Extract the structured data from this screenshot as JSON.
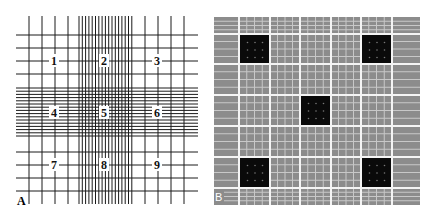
{
  "figure": {
    "panels": [
      {
        "id": "A",
        "label": "A",
        "description": "Hemocytometer counting-chamber ruling (Neubauer grid) with nine numbered large squares",
        "squares": [
          {
            "number": "1",
            "label": "1"
          },
          {
            "number": "2",
            "label": "2"
          },
          {
            "number": "3",
            "label": "3"
          },
          {
            "number": "4",
            "label": "4"
          },
          {
            "number": "5",
            "label": "5"
          },
          {
            "number": "6",
            "label": "6"
          },
          {
            "number": "7",
            "label": "7"
          },
          {
            "number": "8",
            "label": "8"
          },
          {
            "number": "9",
            "label": "9"
          }
        ],
        "line_color": "#1a1a1a",
        "background": "#ffffff"
      },
      {
        "id": "B",
        "label": "B",
        "description": "Grid image with five darkened counting squares (four corners and center)",
        "highlighted_squares": [
          "top-left",
          "top-right",
          "center",
          "bottom-left",
          "bottom-right"
        ],
        "background": "#8c8c8c",
        "line_color": "#f2f2f2",
        "highlight_color": "#0a0a0a"
      }
    ]
  }
}
